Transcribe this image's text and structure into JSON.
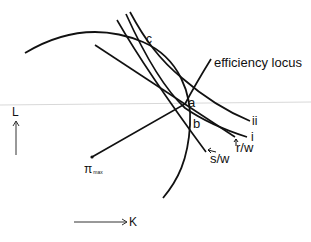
{
  "diagram": {
    "labels": {
      "efficiency_locus": "efficiency locus",
      "point_a": "a",
      "point_b": "b",
      "point_c": "c",
      "curve_i": "i",
      "curve_ii": "ii",
      "ratio_sw": "s/w",
      "ratio_rw": "r/w",
      "pi_max_symbol": "π",
      "pi_max_subscript": "max",
      "axis_l": "L",
      "axis_k": "K"
    },
    "colors": {
      "ink": "#111111",
      "rule": "#d8d8d8",
      "background": "#ffffff"
    }
  }
}
